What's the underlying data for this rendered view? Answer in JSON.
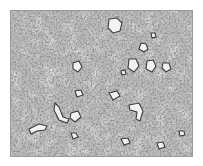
{
  "image": {
    "description": "Grayscale optical micrograph showing a fine-grained mottled microstructure with scattered light irregular grains",
    "colors": {
      "background": "#ffffff",
      "matrix": "#b8b8b8",
      "dark_phase": "#4a4a4a",
      "light_grains": "#ececec",
      "border": "#9a9a9a"
    }
  }
}
